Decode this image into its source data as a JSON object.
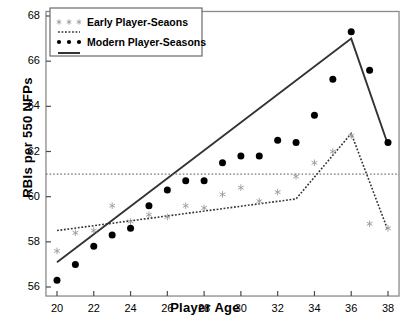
{
  "chart_data": {
    "type": "scatter",
    "title": "",
    "xlabel": "Player Age",
    "ylabel": "RBIs per 550 NFPs",
    "xlim": [
      19.4,
      38.6
    ],
    "ylim": [
      55.6,
      68.2
    ],
    "xticks": [
      20,
      22,
      24,
      26,
      28,
      30,
      32,
      34,
      36,
      38
    ],
    "yticks": [
      56,
      58,
      60,
      62,
      64,
      66,
      68
    ],
    "grid": false,
    "legend_position": "top-left",
    "legend": [
      {
        "label": "Early Player-Seaons",
        "marker": "asterisk",
        "color": "#999999"
      },
      {
        "label": "",
        "marker": "dotted-line",
        "color": "#333333"
      },
      {
        "label": "Modern Player-Seasons",
        "marker": "dot",
        "color": "#000000"
      },
      {
        "label": "",
        "marker": "solid-line",
        "color": "#333333"
      }
    ],
    "x": [
      20,
      21,
      22,
      23,
      24,
      25,
      26,
      27,
      28,
      29,
      30,
      31,
      32,
      33,
      34,
      35,
      36,
      37,
      38
    ],
    "series": [
      {
        "name": "Modern Player-Seasons",
        "marker": "dot",
        "color": "#000000",
        "values": [
          56.3,
          57.0,
          57.8,
          58.3,
          58.6,
          59.6,
          60.3,
          60.7,
          60.7,
          61.5,
          61.8,
          61.8,
          62.5,
          62.4,
          63.6,
          65.2,
          67.3,
          65.6,
          62.4
        ]
      },
      {
        "name": "Early Player-Seaons",
        "marker": "asterisk",
        "color": "#9a9a9a",
        "values": [
          57.6,
          58.4,
          58.5,
          59.6,
          58.9,
          59.2,
          59.1,
          59.6,
          59.5,
          60.1,
          60.4,
          59.8,
          60.2,
          60.9,
          61.5,
          62.0,
          62.7,
          58.8,
          58.6
        ]
      }
    ],
    "fits": [
      {
        "name": "Modern Player-Seasons fit",
        "style": "solid",
        "color": "#333333",
        "points": [
          [
            20,
            57.1
          ],
          [
            36,
            67.0
          ],
          [
            38,
            62.3
          ]
        ]
      },
      {
        "name": "Early Player-Seaons fit",
        "style": "dotted",
        "color": "#333333",
        "points": [
          [
            20,
            58.5
          ],
          [
            33,
            59.9
          ],
          [
            36,
            62.8
          ],
          [
            38,
            58.5
          ]
        ]
      },
      {
        "name": "Reference line",
        "style": "dotted",
        "color": "#555555",
        "points": [
          [
            19.4,
            61.0
          ],
          [
            38.6,
            61.0
          ]
        ]
      }
    ]
  }
}
